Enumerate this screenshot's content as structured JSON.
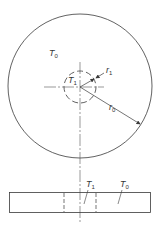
{
  "diagram": {
    "top_view": {
      "outer_region_label": {
        "symbol": "T",
        "sub": "0"
      },
      "inner_region_label": {
        "symbol": "T",
        "sub": "1"
      },
      "inner_radius_label": {
        "symbol": "r",
        "sub": "1"
      },
      "outer_radius_label": {
        "symbol": "r",
        "sub": "0"
      }
    },
    "side_view": {
      "inner_label": {
        "symbol": "T",
        "sub": "1"
      },
      "outer_label": {
        "symbol": "T",
        "sub": "0"
      }
    },
    "colors": {
      "stroke": "#3a3a3a",
      "background": "#ffffff"
    }
  }
}
